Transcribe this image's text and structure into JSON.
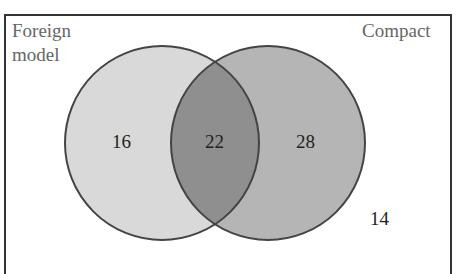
{
  "diagram": {
    "type": "venn",
    "sets": [
      {
        "name": "Foreign model",
        "label_line1": "Foreign",
        "label_line2": "model",
        "only_count": "16",
        "fill": "#d9d9d9"
      },
      {
        "name": "Compact",
        "label": "Compact",
        "only_count": "28",
        "fill": "#b5b5b5"
      }
    ],
    "intersection_count": "22",
    "intersection_fill": "#8f8f8f",
    "outside_count": "14",
    "outline_color": "#444444"
  }
}
